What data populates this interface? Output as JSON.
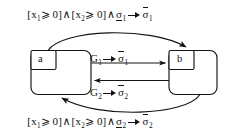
{
  "diagram": {
    "stroke_color": "#141414",
    "background_color": "#ffffff",
    "states": [
      {
        "id": "a",
        "label": "a",
        "x": 30,
        "y": 50,
        "width": 62,
        "height": 45
      },
      {
        "id": "b",
        "label": "b",
        "x": 168,
        "y": 50,
        "width": 50,
        "height": 45
      }
    ],
    "transitions": [
      {
        "id": "t-top",
        "from": "a",
        "to": "b",
        "shape": "curve-above",
        "label": {
          "guard_open": "[",
          "var1": "x",
          "var1_sub": "1",
          "rel1": "⩾ 0]",
          "and1": "∧",
          "guard_open2": "[",
          "var2": "x",
          "var2_sub": "2",
          "rel2": "⩾ 0]",
          "and2": "∧",
          "event": "σ",
          "event_sub": "1",
          "event_decoration": "underline",
          "arrow": "→",
          "action": "σ",
          "action_sub": "1",
          "action_decoration": "overline",
          "plain_text": "[x1 ⩾ 0] ∧ [x2 ⩾ 0] ∧ σ̱₁ → σ̄₁"
        }
      },
      {
        "id": "t-mid-1",
        "from": "a",
        "to": "b",
        "shape": "straight",
        "label": {
          "event": "G",
          "event_sub": "1",
          "arrow": "→",
          "action": "σ",
          "action_sub": "1",
          "action_decoration": "overline",
          "plain_text": "G₁ → σ̄₁"
        }
      },
      {
        "id": "t-mid-2",
        "from": "b",
        "to": "a",
        "shape": "straight",
        "label": {
          "event": "G",
          "event_sub": "2",
          "arrow": "→",
          "action": "σ",
          "action_sub": "2",
          "action_decoration": "overline",
          "plain_text": "G₂ → σ̄₂"
        }
      },
      {
        "id": "t-bottom",
        "from": "b",
        "to": "a",
        "shape": "curve-below",
        "label": {
          "guard_open": "[",
          "var1": "x",
          "var1_sub": "1",
          "rel1": "⩾ 0]",
          "and1": "∧",
          "guard_open2": "[",
          "var2": "x",
          "var2_sub": "2",
          "rel2": "⩾ 0]",
          "and2": "∧",
          "event": "σ",
          "event_sub": "2",
          "event_decoration": "underline",
          "arrow": "→",
          "action": "σ",
          "action_sub": "2",
          "action_decoration": "overline",
          "plain_text": "[x1 ⩾ 0] ∧ [x2 ⩾ 0] ∧ σ̱₂ → σ̄₂"
        }
      }
    ]
  }
}
